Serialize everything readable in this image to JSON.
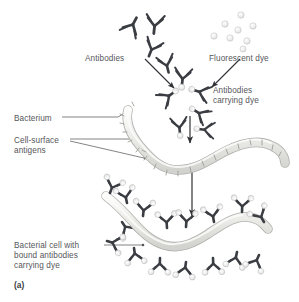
{
  "figure": {
    "panel_id": "(a)",
    "background_color": "#ffffff",
    "text_color": "#55565a",
    "antibody_color": "#3a3d42",
    "dye_color": "#e8e8e8",
    "dye_stroke": "#b9b9b9",
    "bacterium_fill": "#e9e9e7",
    "bacterium_stroke": "#b0b0ac",
    "leader_color": "#6e6e6e",
    "arrow_color": "#2f3134"
  },
  "labels": [
    {
      "id": "antibodies",
      "text": "Antibodies",
      "x": 85,
      "y": 54
    },
    {
      "id": "fluorescent-dye",
      "text": "Fluorescent dye",
      "x": 209,
      "y": 54
    },
    {
      "id": "antibodies-dye",
      "text": "Antibodies\ncarrying dye",
      "x": 213,
      "y": 86
    },
    {
      "id": "bacterium",
      "text": "Bacterium",
      "x": 14,
      "y": 114
    },
    {
      "id": "cell-surface-antigens",
      "text": "Cell-surface\nantigens",
      "x": 14,
      "y": 136
    },
    {
      "id": "bacterial-cell-bound",
      "text": "Bacterial cell with\nbound antibodies\ncarrying dye",
      "x": 14,
      "y": 241
    }
  ],
  "elements": {
    "free_antibodies_count": 4,
    "dye_particles_count": 8,
    "dye_labelled_antibodies_count": 6,
    "bound_antibodies_count": 16,
    "bacteria_count": 2,
    "arrows_count": 4
  }
}
